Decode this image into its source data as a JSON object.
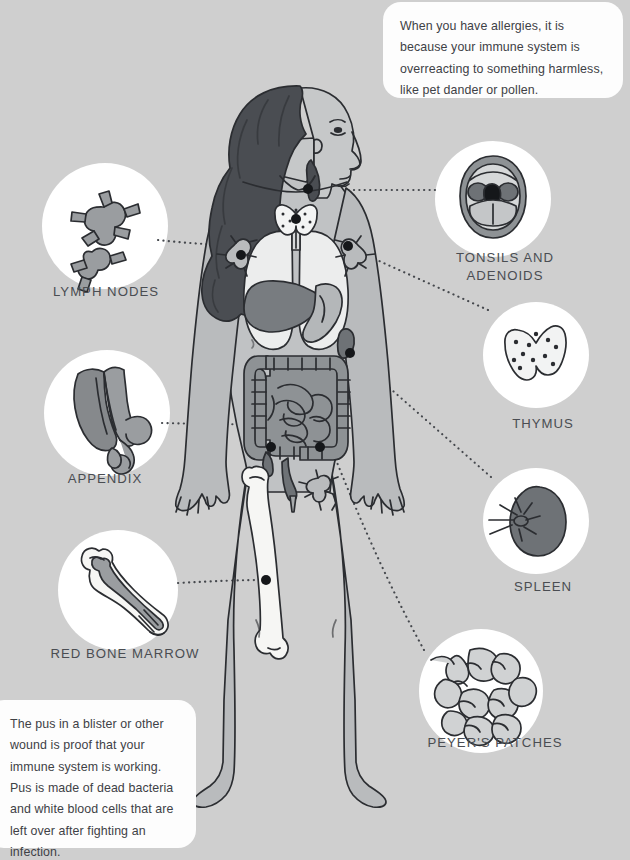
{
  "page": {
    "background_color": "#cfcfcf",
    "width": 630,
    "height": 837
  },
  "colors": {
    "background": "#cfcfcf",
    "callout_bg": "#fdfdfd",
    "circle_bg": "#ffffff",
    "text": "#4a4d52",
    "skin": "#b9bbbd",
    "skin_light": "#c6c8c9",
    "hair": "#4a4d52",
    "organ_dark": "#6e7276",
    "organ_mid": "#9a9da0",
    "organ_light": "#d8dadb",
    "bone": "#f6f6f4",
    "outline": "#2b2d31"
  },
  "callouts": [
    {
      "id": "allergies",
      "text": "When you have allergies, it is because your immune system is overreacting to something harmless, like pet dander or pollen."
    },
    {
      "id": "pus",
      "text": "The pus in a blister or other wound is proof that your immune system is working. Pus is made of dead bacteria and white blood cells that are left over after fighting an infection."
    }
  ],
  "organs": {
    "lymph_nodes": {
      "label": "LYMPH NODES",
      "icon": "lymph-nodes-icon",
      "side": "left"
    },
    "appendix": {
      "label": "APPENDIX",
      "icon": "appendix-icon",
      "side": "left"
    },
    "red_bone_marrow": {
      "label": "RED BONE MARROW",
      "icon": "bone-marrow-icon",
      "side": "left"
    },
    "tonsils_adenoids": {
      "label": "TONSILS AND\nADENOIDS",
      "icon": "tonsils-adenoids-icon",
      "side": "right"
    },
    "thymus": {
      "label": "THYMUS",
      "icon": "thymus-icon",
      "side": "right"
    },
    "spleen": {
      "label": "SPLEEN",
      "icon": "spleen-icon",
      "side": "right"
    },
    "peyers_patches": {
      "label": "PEYER'S PATCHES",
      "icon": "peyers-patches-icon",
      "side": "right"
    }
  },
  "figure": {
    "name": "human-body-diagram"
  }
}
